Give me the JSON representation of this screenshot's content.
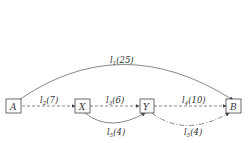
{
  "nodes": [
    {
      "id": "A",
      "label": "A"
    },
    {
      "id": "X",
      "label": "X"
    },
    {
      "id": "Y",
      "label": "Y"
    },
    {
      "id": "B",
      "label": "B"
    }
  ],
  "edges": [
    {
      "from": "A",
      "to": "B",
      "name": "l",
      "sub": "1",
      "value": "(25)",
      "style": "solid-arc-top"
    },
    {
      "from": "A",
      "to": "X",
      "name": "l",
      "sub": "2",
      "value": "(7)",
      "style": "dashed"
    },
    {
      "from": "X",
      "to": "Y",
      "name": "l",
      "sub": "3",
      "value": "(6)",
      "style": "dashed"
    },
    {
      "from": "Y",
      "to": "B",
      "name": "l",
      "sub": "4",
      "value": "(10)",
      "style": "dashed"
    },
    {
      "from": "X",
      "to": "Y",
      "name": "l",
      "sub": "5",
      "value": "(4)",
      "style": "solid-arc-bottom"
    },
    {
      "from": "Y",
      "to": "B",
      "name": "l",
      "sub": "5",
      "value": "(4)",
      "style": "dashdot-arc-bottom"
    }
  ]
}
